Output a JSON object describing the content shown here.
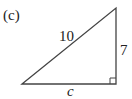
{
  "figure": {
    "panel_label": "(c)",
    "shape": "right-triangle",
    "colors": {
      "stroke": "#444444",
      "text": "#222222",
      "background": "#ffffff"
    },
    "vertices": {
      "top": [
        116,
        8
      ],
      "bottom_left": [
        22,
        84
      ],
      "bottom_right": [
        116,
        84
      ]
    },
    "right_angle_at": "bottom_right",
    "sides": {
      "hypotenuse": {
        "label": "10"
      },
      "vertical_leg": {
        "label": "7"
      },
      "base_leg": {
        "label": "c"
      }
    }
  }
}
